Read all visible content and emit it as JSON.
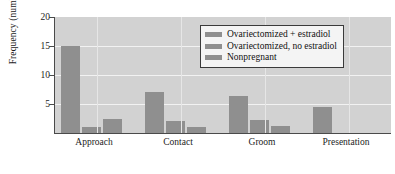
{
  "chart_data": {
    "type": "bar",
    "title": "",
    "subtitle": "",
    "xlabel": "",
    "ylabel": "Frequency (number/6 h)",
    "categories": [
      "Approach",
      "Contact",
      "Groom",
      "Presentation"
    ],
    "series": [
      {
        "name": "Ovariectomized + estradiol",
        "color": "#8f8f8f",
        "values": [
          15,
          7,
          6.3,
          4.5
        ]
      },
      {
        "name": "Ovariectomized, no estradiol",
        "color": "#8f8f8f",
        "values": [
          1,
          2,
          2.3,
          0
        ]
      },
      {
        "name": "Nonpregnant",
        "color": "#8f8f8f",
        "values": [
          2.5,
          1,
          1.2,
          0
        ]
      }
    ],
    "ylim": [
      0,
      20
    ],
    "yticks": [
      5,
      10,
      15,
      20
    ],
    "ytick_labels": [
      "5",
      "10",
      "15",
      "20"
    ],
    "grid": true,
    "grid_axis": "y",
    "legend_position": "top-right",
    "plot_background": "#d2d2d2",
    "gridline_color": "#f2f2f2",
    "axis_color": "#4a4a4a"
  }
}
